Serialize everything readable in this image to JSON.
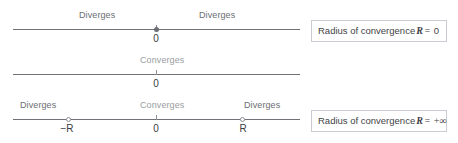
{
  "figure": {
    "rows": [
      {
        "id": "row-r-zero",
        "line": {
          "start_value": "-inf",
          "end_value": "+inf"
        },
        "region_labels": [
          {
            "text": "Diverges",
            "position": "left",
            "style": "dark"
          },
          {
            "text": "Diverges",
            "position": "right",
            "style": "dark"
          }
        ],
        "markers": [
          {
            "value_label": "0",
            "type": "filled-dot"
          }
        ],
        "callout": {
          "prefix": "Radius of convergence",
          "symbol": "R",
          "relation": "=",
          "value": "0"
        }
      },
      {
        "id": "row-r-infinite",
        "line": {
          "start_value": "-inf",
          "end_value": "+inf"
        },
        "region_labels": [
          {
            "text": "Converges",
            "position": "center",
            "style": "muted"
          }
        ],
        "markers": [
          {
            "value_label": "0",
            "type": "tick"
          }
        ],
        "callout": {
          "prefix": "Radius of convergence",
          "symbol": "R",
          "relation": "=",
          "value": "+∞"
        }
      },
      {
        "id": "row-r-finite",
        "line": {
          "start_value": "-inf",
          "end_value": "+inf"
        },
        "region_labels": [
          {
            "text": "Diverges",
            "position": "left",
            "style": "dark"
          },
          {
            "text": "Converges",
            "position": "center",
            "style": "muted"
          },
          {
            "text": "Diverges",
            "position": "right",
            "style": "dark"
          }
        ],
        "markers": [
          {
            "value_label": "−R",
            "type": "open-circle"
          },
          {
            "value_label": "0",
            "type": "tick"
          },
          {
            "value_label": "R",
            "type": "open-circle"
          }
        ],
        "callout": {
          "prefix": "Radius of convergence",
          "symbol": "R",
          "relation": "",
          "value": ""
        }
      }
    ],
    "colors": {
      "line": "#6e7176",
      "label_dark": "#6b6e73",
      "label_muted": "#9a9da1",
      "axis_value": "#3a3c40",
      "callout_border": "#c9ccd0",
      "callout_text": "#3f4246",
      "background": "#ffffff"
    }
  }
}
